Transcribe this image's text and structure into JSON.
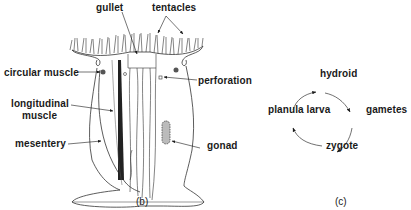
{
  "figure_b": {
    "caption": "(b)",
    "labels": {
      "gullet": "gullet",
      "tentacles": "tentacles",
      "circular_muscle": "circular muscle",
      "perforation": "perforation",
      "longitudinal_muscle_line1": "longitudinal",
      "longitudinal_muscle_line2": "muscle",
      "mesentery": "mesentery",
      "gonad": "gonad"
    }
  },
  "figure_c": {
    "caption": "(c)",
    "cycle": [
      "hydroid",
      "gametes",
      "zygote",
      "planula larva"
    ]
  },
  "colors": {
    "ink": "#1a1a1a",
    "background": "#ffffff"
  }
}
